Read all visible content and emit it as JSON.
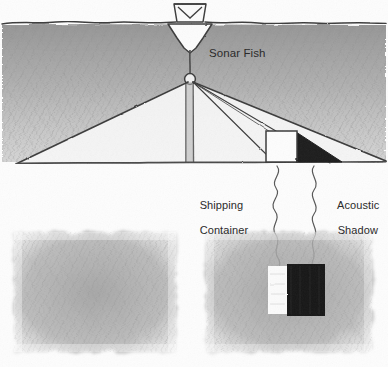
{
  "figure": {
    "style": "pencil sketch",
    "width": 388,
    "height": 367,
    "background_color": "#fdfdfd"
  },
  "colors": {
    "ink": "#3b3b3b",
    "text": "#2b2b2b",
    "water_shading": "#a8a8a8",
    "seafloor_line": "#4a4a4a",
    "shadow_fill": "#1c1c1c",
    "container_fill": "#fcfcfc",
    "sonar_panel_fill": "#b4b4b4",
    "sonar_target_bright": "#fbfbfb",
    "sonar_shadow_dark": "#161616"
  },
  "diagram": {
    "labels": {
      "sonar_fish": "Sonar Fish",
      "shipping_container_line1": "Shipping",
      "shipping_container_line2": "Container",
      "acoustic_shadow_line1": "Acoustic",
      "acoustic_shadow_line2": "Shadow"
    },
    "elements": {
      "water_surface": "water-surface-line",
      "vessel": "survey-boat",
      "tow_cable": "tow-cable",
      "towfish": "sonar-towfish",
      "beam_fan_left": "acoustic-beam-port",
      "beam_fan_right": "acoustic-beam-starboard",
      "seafloor": "seafloor-line",
      "container": "shipping-container-box",
      "shadow": "acoustic-shadow-wedge"
    }
  },
  "panels": [
    {
      "id": "left-sonar-panel",
      "name": "sonargram-empty-seafloor",
      "caption": "",
      "x": 14,
      "y": 232,
      "width": 162,
      "height": 120
    },
    {
      "id": "right-sonar-panel",
      "name": "sonargram-with-target",
      "caption": "",
      "x": 206,
      "y": 232,
      "width": 166,
      "height": 120,
      "features": {
        "bright_return": "container-acoustic-return",
        "dark_shadow": "container-acoustic-shadow"
      }
    }
  ],
  "leader_lines": [
    {
      "name": "leader-shipping-container",
      "from_label": "Shipping Container",
      "to_panel": "right-sonar-panel"
    },
    {
      "name": "leader-acoustic-shadow",
      "from_label": "Acoustic Shadow",
      "to_panel": "right-sonar-panel"
    }
  ]
}
